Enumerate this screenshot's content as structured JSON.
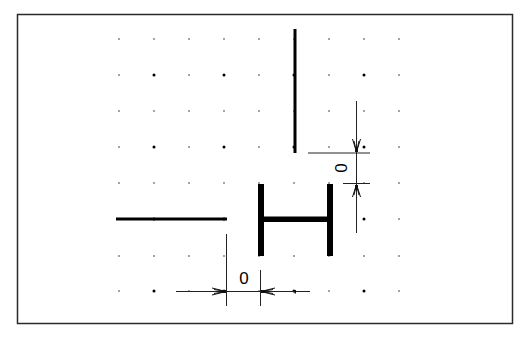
{
  "diagram": {
    "type": "cad-dimension-drawing",
    "frame": {
      "x1": 17,
      "y1": 14,
      "x2": 513,
      "y2": 324,
      "stroke": "#333333"
    },
    "grid": {
      "columns": [
        119,
        154,
        189,
        224,
        259,
        294,
        329,
        364,
        399
      ],
      "rows": [
        39,
        75,
        111,
        147,
        183,
        219,
        256,
        291
      ],
      "major_columns": [
        154,
        224,
        294,
        364
      ],
      "major_rows": [
        75,
        147,
        219,
        291
      ],
      "dot_color": "#000000"
    },
    "shapes": [
      {
        "name": "vertical-line",
        "type": "line",
        "x1": 295,
        "y1": 29,
        "x2": 295,
        "y2": 153,
        "width": 3
      },
      {
        "name": "horizontal-line",
        "type": "line",
        "x1": 116,
        "y1": 219,
        "x2": 227,
        "y2": 219,
        "width": 3
      },
      {
        "name": "h-shape-left-bar",
        "type": "rect",
        "x": 259,
        "y": 184,
        "w": 5,
        "h": 72
      },
      {
        "name": "h-shape-right-bar",
        "type": "rect",
        "x": 328,
        "y": 184,
        "w": 5,
        "h": 72
      },
      {
        "name": "h-shape-crossbar",
        "type": "rect",
        "x": 264,
        "y": 217,
        "w": 64,
        "h": 5
      }
    ],
    "dimensions": [
      {
        "name": "vertical-gap-dimension",
        "orientation": "vertical",
        "value": "0",
        "text_x": 343,
        "text_y": 168,
        "text_rotation": -90
      },
      {
        "name": "horizontal-gap-dimension",
        "orientation": "horizontal",
        "value": "0",
        "text_x": 244,
        "text_y": 284,
        "text_rotation": 0
      }
    ]
  }
}
